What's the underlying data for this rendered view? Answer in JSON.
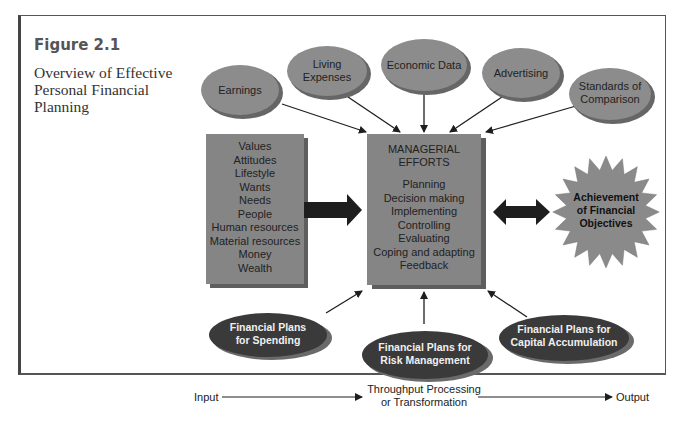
{
  "figure": {
    "label": "Figure 2.1",
    "title_lines": [
      "Overview of Effective",
      "Personal Financial",
      "Planning"
    ]
  },
  "inputs_ovals": [
    {
      "lines": [
        "Earnings"
      ]
    },
    {
      "lines": [
        "Living",
        "Expenses"
      ]
    },
    {
      "lines": [
        "Economic Data"
      ]
    },
    {
      "lines": [
        "Advertising"
      ]
    },
    {
      "lines": [
        "Standards of",
        "Comparison"
      ]
    }
  ],
  "resources_box": {
    "items": [
      "Values",
      "Attitudes",
      "Lifestyle",
      "Wants",
      "Needs",
      "People",
      "Human resources",
      "Material resources",
      "Money",
      "Wealth"
    ]
  },
  "managerial_box": {
    "heading": [
      "MANAGERIAL",
      "EFFORTS"
    ],
    "items": [
      "Planning",
      "Decision making",
      "Implementing",
      "Controlling",
      "Evaluating",
      "Coping and adapting",
      "Feedback"
    ]
  },
  "objective_star": {
    "lines": [
      "Achievement",
      "of Financial",
      "Objectives"
    ]
  },
  "plan_ovals": [
    {
      "lines": [
        "Financial Plans",
        "for Spending"
      ]
    },
    {
      "lines": [
        "Financial Plans for",
        "Risk Management"
      ]
    },
    {
      "lines": [
        "Financial Plans for",
        "Capital Accumulation"
      ]
    }
  ],
  "flow": {
    "input": "Input",
    "throughput": [
      "Throughput Processing",
      "or Transformation"
    ],
    "output": "Output"
  },
  "colors": {
    "oval_fill": "#8c8c8c",
    "box_fill": "#858585",
    "dark_oval_fill": "#3a3a3a",
    "star_fill": "#8a8a8a",
    "arrow": "#1e1e1e"
  }
}
